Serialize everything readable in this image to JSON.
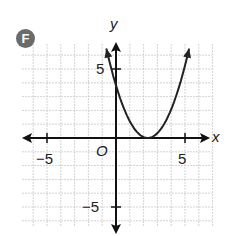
{
  "badge": {
    "label": "F"
  },
  "axes": {
    "x_label": "x",
    "y_label": "y",
    "origin_label": "O",
    "x_tick_labels": [
      "−5",
      "5"
    ],
    "y_tick_labels": [
      "5",
      "−5"
    ]
  },
  "chart_data": {
    "type": "line",
    "title": "F",
    "xlabel": "x",
    "ylabel": "y",
    "xlim": [
      -7,
      7
    ],
    "ylim": [
      -7,
      7
    ],
    "grid": true,
    "x_ticks_labeled": [
      -5,
      5
    ],
    "y_ticks_labeled": [
      5,
      -5
    ],
    "series": [
      {
        "name": "parabola",
        "equation": "y = (x - 2)^2",
        "vertex": [
          2,
          0
        ],
        "y_intercept": 4,
        "x": [
          -0.7,
          0,
          1,
          2,
          3,
          4,
          4.7
        ],
        "values": [
          7.29,
          4,
          1,
          0,
          1,
          4,
          7.29
        ]
      }
    ]
  }
}
